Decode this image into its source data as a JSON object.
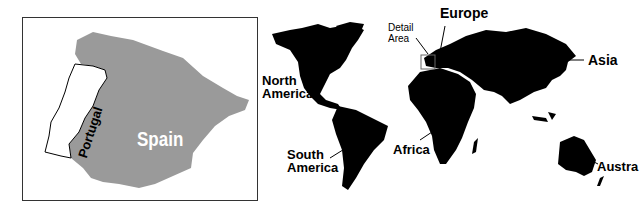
{
  "inset_map": {
    "title": "Detail of Iberian Peninsula",
    "regions": [
      {
        "name": "Spain",
        "label": "Spain",
        "fill": "#9a9a9a",
        "label_color": "#ffffff"
      },
      {
        "name": "Portugal",
        "label": "Portugal",
        "fill": "#ffffff",
        "label_color": "#000000"
      }
    ]
  },
  "world_map": {
    "land_color": "#000000",
    "labels": {
      "north_america": [
        "North",
        "America"
      ],
      "south_america": [
        "South",
        "America"
      ],
      "europe": "Europe",
      "asia": "Asia",
      "africa": "Africa",
      "australia": "Austra",
      "detail_area": [
        "Detail",
        "Area"
      ]
    }
  }
}
